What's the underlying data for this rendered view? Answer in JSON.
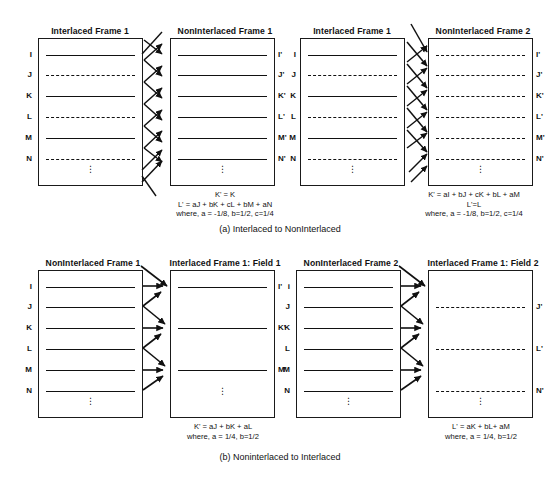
{
  "figure": {
    "sections": [
      {
        "id": "a",
        "caption": "(a) Interlaced to NonInterlaced",
        "groups": [
          {
            "id": "a1",
            "source": {
              "title": "Interlaced Frame 1",
              "row_labels": [
                "I",
                "J",
                "K",
                "L",
                "M",
                "N"
              ],
              "line_styles": [
                "solid",
                "dashed",
                "solid",
                "dashed",
                "solid",
                "dashed"
              ]
            },
            "target": {
              "title": "NonInterlaced Frame 1",
              "row_labels": [
                "I'",
                "J'",
                "K'",
                "L'",
                "M'",
                "N'"
              ],
              "line_styles": [
                "solid",
                "solid",
                "solid",
                "solid",
                "solid",
                "solid"
              ]
            },
            "formula": [
              "K' = K",
              "L' = aJ + bK + cL + bM + aN",
              "where, a = -1/8, b=1/2, c=1/4"
            ]
          },
          {
            "id": "a2",
            "source": {
              "title": "Interlaced Frame 1",
              "row_labels": [
                "I",
                "J",
                "K",
                "L",
                "M",
                "N"
              ],
              "line_styles": [
                "solid",
                "dashed",
                "solid",
                "dashed",
                "solid",
                "dashed"
              ]
            },
            "target": {
              "title": "NonInterlaced Frame 2",
              "row_labels": [
                "I'",
                "J'",
                "K'",
                "L'",
                "M'",
                "N'"
              ],
              "line_styles": [
                "dashed",
                "dashed",
                "dashed",
                "dashed",
                "dashed",
                "dashed"
              ]
            },
            "formula": [
              "K' = aI + bJ + cK + bL + aM",
              "L'=L",
              "where, a = -1/8, b=1/2, c=1/4"
            ]
          }
        ]
      },
      {
        "id": "b",
        "caption": "(b) Noninterlaced to Interlaced",
        "groups": [
          {
            "id": "b1",
            "source": {
              "title": "NonInterlaced Frame 1",
              "row_labels": [
                "I",
                "J",
                "K",
                "L",
                "M",
                "N"
              ],
              "line_styles": [
                "solid",
                "solid",
                "solid",
                "solid",
                "solid",
                "solid"
              ]
            },
            "target": {
              "title": "Interlaced Frame 1: Field 1",
              "row_labels": [
                "I'",
                "",
                "K'",
                "",
                "M'",
                ""
              ],
              "line_styles": [
                "solid",
                "none",
                "solid",
                "none",
                "solid",
                "none"
              ]
            },
            "formula": [
              "K' = aJ + bK +  aL",
              "where, a = 1/4, b=1/2"
            ]
          },
          {
            "id": "b2",
            "source": {
              "title": "NonInterlaced Frame 2",
              "row_labels": [
                "i",
                "J",
                "K",
                "L",
                "M",
                "N"
              ],
              "line_styles": [
                "solid",
                "solid",
                "solid",
                "solid",
                "solid",
                "solid"
              ]
            },
            "target": {
              "title": "Interlaced Frame 1: Field 2",
              "row_labels": [
                "",
                "J'",
                "",
                "L'",
                "",
                "N'"
              ],
              "line_styles": [
                "none",
                "dashed",
                "none",
                "dashed",
                "none",
                "dashed"
              ]
            },
            "formula": [
              "L' = aK + bL+  aM",
              "where, a = 1/4, b=1/2"
            ]
          }
        ]
      }
    ],
    "ellipsis_glyph": "⋮",
    "colors": {
      "ink": "#111111",
      "background": "#ffffff"
    }
  }
}
